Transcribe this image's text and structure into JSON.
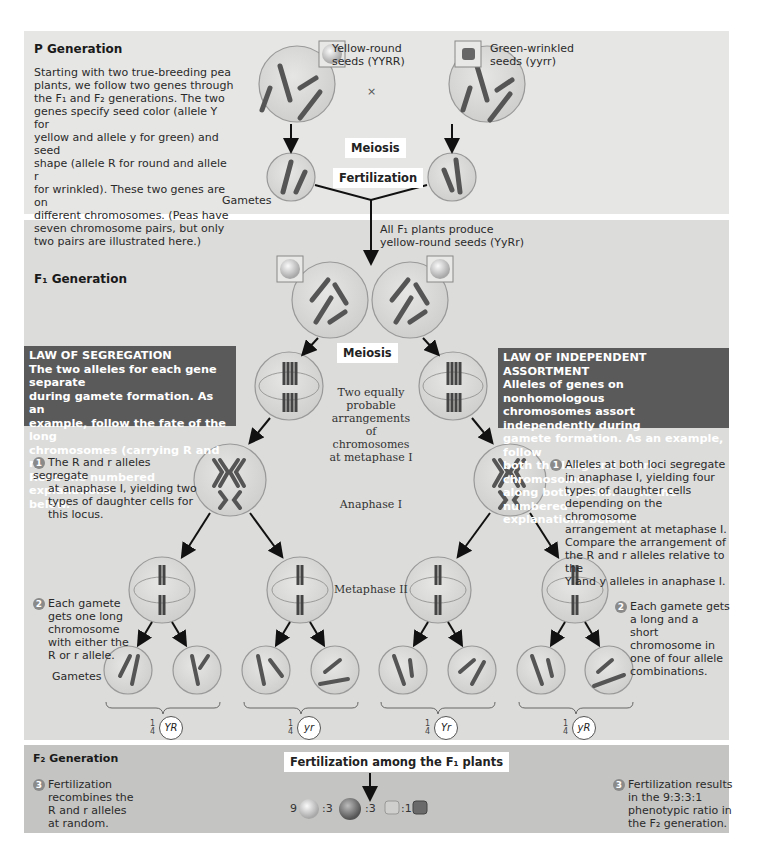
{
  "p_generation": {
    "title": "P Generation",
    "description": "Starting with two true-breeding pea plants, we follow two genes through the F1 and F2 generations. The two genes specify seed color (allele Y for yellow and allele y for green) and seed shape (allele R for round and allele r for wrinkled). These two genes are on different chromosomes. (Peas have seven chromosome pairs, but only two pairs are illustrated here.)",
    "desc_lines": [
      "Starting with two true-breeding pea",
      "plants, we follow two genes through",
      "the F₁ and F₂ generations. The two",
      "genes specify seed color (allele Y for",
      "yellow and allele y for green) and seed",
      "shape (allele R for round and allele r",
      "for wrinkled). These two genes are on",
      "different chromosomes. (Peas have",
      "seven chromosome pairs, but only",
      "two pairs are illustrated here.)"
    ],
    "parent1_label_line1": "Yellow-round",
    "parent1_label_line2": "seeds (YYRR)",
    "parent2_label_line1": "Green-wrinkled",
    "parent2_label_line2": "seeds (yyrr)",
    "cross_symbol": "×",
    "meiosis_label": "Meiosis",
    "fertilization_label": "Fertilization",
    "gametes_label": "Gametes",
    "parent1_gamete_alleles": [
      "R",
      "Y"
    ],
    "parent2_gamete_alleles": [
      "y",
      "r"
    ]
  },
  "f1_generation": {
    "title": "F₁ Generation",
    "f1_note_line1": "All F₁ plants produce",
    "f1_note_line2": "yellow-round seeds (YyRr)",
    "meiosis_label": "Meiosis",
    "metaphase1_note": [
      "Two equally",
      "probable",
      "arrangements",
      "of chromosomes",
      "at metaphase I"
    ],
    "anaphase1_label": "Anaphase I",
    "metaphase2_label": "Metaphase II",
    "gametes_label": "Gametes",
    "law_segregation": {
      "title": "LAW OF SEGREGATION",
      "lines": [
        "The two alleles for each gene separate",
        "during gamete formation. As an",
        "example, follow the fate of the long",
        "chromosomes (carrying R and r).",
        "Read the numbered explanations",
        "below."
      ]
    },
    "law_independent_assortment": {
      "title": "LAW OF INDEPENDENT ASSORTMENT",
      "lines": [
        "Alleles of genes on nonhomologous",
        "chromosomes assort independently during",
        "gamete formation. As an example, follow",
        "both the long and short chromosomes",
        "along both paths. Read the numbered",
        "explanations below."
      ]
    },
    "left_steps": [
      {
        "num": "1",
        "lines": [
          "The R and r alleles segregate",
          "at anaphase I, yielding two",
          "types of daughter cells for",
          "this locus."
        ]
      },
      {
        "num": "2",
        "lines": [
          "Each gamete",
          "gets one long",
          "chromosome",
          "with either the",
          "R or r allele."
        ]
      }
    ],
    "right_steps": [
      {
        "num": "1",
        "lines": [
          "Alleles at both loci segregate",
          "in anaphase I, yielding four",
          "types of daughter cells",
          "depending on the chromosome",
          "arrangement at metaphase I.",
          "Compare the arrangement of",
          "the R and r alleles relative to the",
          "Y and y alleles in anaphase I."
        ]
      },
      {
        "num": "2",
        "lines": [
          "Each gamete gets",
          "a long and a short",
          "chromosome in",
          "one of four allele",
          "combinations."
        ]
      }
    ],
    "gamete_types": [
      {
        "fraction_num": "1",
        "fraction_den": "4",
        "genotype": "YR"
      },
      {
        "fraction_num": "1",
        "fraction_den": "4",
        "genotype": "yr"
      },
      {
        "fraction_num": "1",
        "fraction_den": "4",
        "genotype": "Yr"
      },
      {
        "fraction_num": "1",
        "fraction_den": "4",
        "genotype": "yR"
      }
    ]
  },
  "f2_generation": {
    "title": "F₂ Generation",
    "fertilization_label": "Fertilization among the F₁ plants",
    "left_step": {
      "num": "3",
      "lines": [
        "Fertilization",
        "recombines the",
        "R and r alleles",
        "at random."
      ]
    },
    "right_step": {
      "num": "3",
      "lines": [
        "Fertilization results",
        "in the 9:3:3:1",
        "phenotypic ratio in",
        "the F₂ generation."
      ]
    },
    "ratio": [
      {
        "count": "9",
        "phenotype": "yellow-round"
      },
      {
        "count": ":3",
        "phenotype": "green-round"
      },
      {
        "count": ":3",
        "phenotype": "yellow-wrinkled"
      },
      {
        "count": ":1",
        "phenotype": "green-wrinkled"
      }
    ]
  },
  "colors": {
    "p_panel_bg": "#e6e6e4",
    "f1_panel_bg": "#dcdcda",
    "f2_panel_bg": "#c4c4c2",
    "law_box_bg": "#5a5a5a",
    "cell_fill": "#d2d2d0",
    "chromosome": "#6a6a6a"
  }
}
